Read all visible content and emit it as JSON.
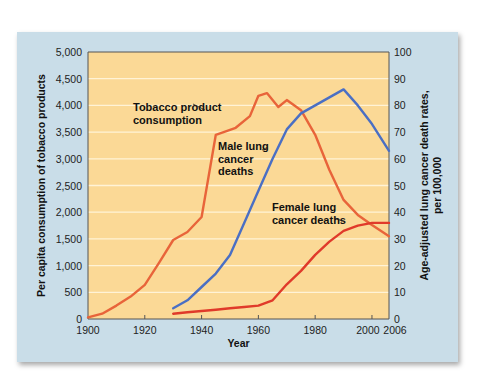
{
  "chart_data": {
    "type": "line",
    "title": "",
    "xlabel": "Year",
    "ylabel_left": "Per capita consumption of tobacco products",
    "ylabel_right": "Age-adjusted lung cancer death rates, per 100,000",
    "xlim": [
      1900,
      2006
    ],
    "ylim_left": [
      0,
      5000
    ],
    "ylim_right": [
      0,
      100
    ],
    "x_ticks": [
      "1900",
      "1920",
      "1940",
      "1960",
      "1980",
      "2000",
      "2006"
    ],
    "y_ticks_left": [
      "0",
      "500",
      "1,000",
      "1,500",
      "2,000",
      "2,500",
      "3,000",
      "3,500",
      "4,000",
      "4,500",
      "5,000"
    ],
    "y_ticks_right": [
      "0",
      "10",
      "20",
      "30",
      "40",
      "50",
      "60",
      "70",
      "80",
      "90",
      "100"
    ],
    "grid": true,
    "series": [
      {
        "name": "Tobacco product consumption",
        "axis": "left",
        "color": "#e8643a",
        "x": [
          1900,
          1905,
          1910,
          1915,
          1920,
          1925,
          1930,
          1935,
          1940,
          1945,
          1952,
          1957,
          1960,
          1963,
          1967,
          1970,
          1975,
          1980,
          1985,
          1990,
          1995,
          2000,
          2006
        ],
        "y": [
          30,
          100,
          250,
          420,
          640,
          1050,
          1480,
          1630,
          1910,
          3450,
          3580,
          3800,
          4180,
          4230,
          3970,
          4100,
          3910,
          3450,
          2790,
          2230,
          1950,
          1760,
          1550
        ]
      },
      {
        "name": "Male lung cancer deaths",
        "axis": "right",
        "color": "#4a6fc4",
        "x": [
          1930,
          1935,
          1940,
          1945,
          1950,
          1955,
          1960,
          1965,
          1970,
          1975,
          1980,
          1985,
          1990,
          1995,
          2000,
          2006
        ],
        "y": [
          4,
          7,
          12,
          17,
          24,
          36,
          48,
          60,
          71,
          77,
          80,
          83,
          86,
          80,
          73,
          63
        ]
      },
      {
        "name": "Female lung cancer deaths",
        "axis": "right",
        "color": "#e03a2a",
        "x": [
          1930,
          1935,
          1940,
          1945,
          1950,
          1955,
          1960,
          1965,
          1970,
          1975,
          1980,
          1985,
          1990,
          1995,
          2000,
          2006
        ],
        "y": [
          2,
          2.5,
          3,
          3.5,
          4,
          4.5,
          5,
          7,
          13,
          18,
          24,
          29,
          33,
          35,
          36,
          36
        ]
      }
    ],
    "annotations": [
      {
        "text": [
          "Tobacco product",
          "consumption"
        ],
        "target": "Tobacco product consumption"
      },
      {
        "text": [
          "Male lung",
          "cancer",
          "deaths"
        ],
        "target": "Male lung cancer deaths"
      },
      {
        "text": [
          "Female lung",
          "cancer deaths"
        ],
        "target": "Female lung cancer deaths"
      }
    ],
    "colors": {
      "panel_bg": "#c9dde8",
      "plot_bg": "#fbd996",
      "grid": "#fff3d6"
    }
  }
}
